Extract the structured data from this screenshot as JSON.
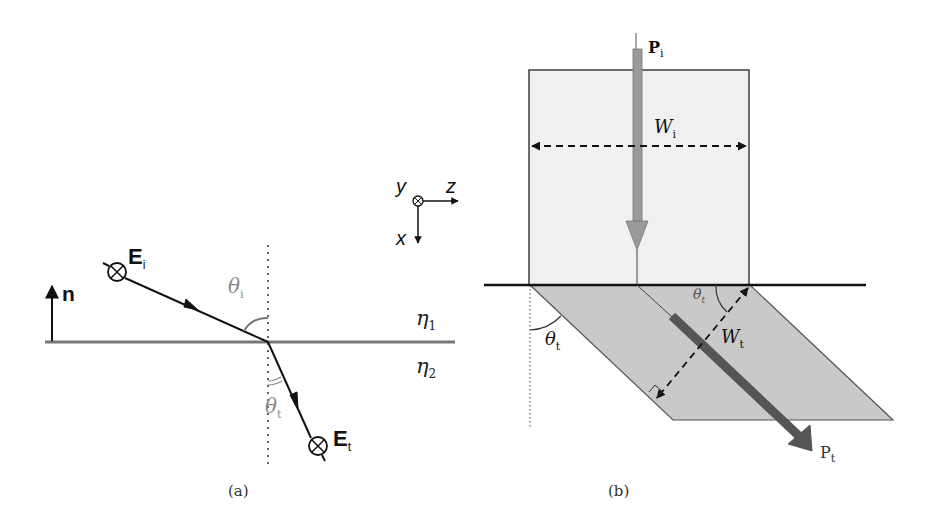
{
  "figure": {
    "panel_a": {
      "caption": "(a)",
      "normal_label": "n",
      "incident_field": {
        "base": "E",
        "sub": "i"
      },
      "transmitted_field": {
        "base": "E",
        "sub": "t"
      },
      "incident_angle": {
        "base": "θ",
        "sub": "i"
      },
      "transmitted_angle": {
        "base": "θ",
        "sub": "t"
      },
      "medium_1": {
        "base": "η",
        "sub": "1"
      },
      "medium_2": {
        "base": "η",
        "sub": "2"
      }
    },
    "axes": {
      "y_label": "y",
      "z_label": "z",
      "x_label": "x"
    },
    "panel_b": {
      "caption": "(b)",
      "incident_power": {
        "base": "P",
        "sub": "i"
      },
      "transmitted_power": {
        "base": "P",
        "sub": "t"
      },
      "incident_width": {
        "base": "W",
        "sub": "i"
      },
      "transmitted_width": {
        "base": "W",
        "sub": "t"
      },
      "angle_outer": {
        "base": "θ",
        "sub": "t"
      },
      "angle_inner": {
        "base": "θ",
        "sub": "t"
      }
    },
    "colors": {
      "line": "#111111",
      "interface_a": "#777777",
      "angle_gray": "#8a8a8a",
      "beam_in_fill": "#f0f0f0",
      "beam_out_fill": "#c9c9c9",
      "arrow_in": "#9a9a9a",
      "arrow_out": "#555555"
    }
  }
}
